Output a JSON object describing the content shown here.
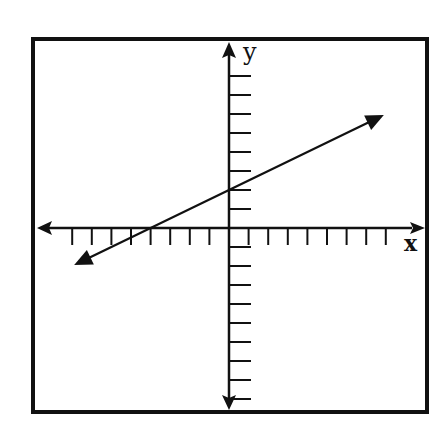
{
  "chart_data": {
    "type": "line",
    "title": "",
    "xlabel": "x",
    "ylabel": "y",
    "xlim": [
      -8,
      8
    ],
    "ylim": [
      -9,
      9
    ],
    "x_ticks": [
      -8,
      -7,
      -6,
      -5,
      -4,
      -3,
      -2,
      -1,
      1,
      2,
      3,
      4,
      5,
      6,
      7,
      8
    ],
    "y_ticks": [
      -9,
      -8,
      -7,
      -6,
      -5,
      -4,
      -3,
      -2,
      -1,
      1,
      2,
      3,
      4,
      5,
      6,
      7,
      8
    ],
    "tick_labels_shown": false,
    "grid": false,
    "legend": null,
    "series": [
      {
        "name": "line",
        "equation": "y = 0.5x + 2",
        "slope": 0.5,
        "intercept": 2,
        "x_intercept": -4,
        "x": [
          -7.9,
          -4,
          0,
          7.9
        ],
        "y": [
          -1.95,
          0,
          2,
          5.95
        ],
        "arrows": "both"
      }
    ],
    "annotations": [
      "small square marker at origin (first quadrant IV unit box)"
    ]
  },
  "labels": {
    "x_axis": "x",
    "y_axis": "y"
  },
  "colors": {
    "ink": "#111111",
    "background": "#ffffff"
  }
}
